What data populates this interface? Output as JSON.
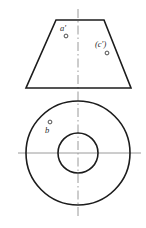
{
  "sheet": {
    "title": "Orthographic projection of a truncated cone with through hole",
    "background_color": "#ffffff",
    "width": 146,
    "height": 228
  },
  "style": {
    "outline_color": "#1c1c1c",
    "centerline_color": "#9a9a9a",
    "label_color": "#2a2a2a",
    "marker_color": "#3a3a3a"
  },
  "front_view": {
    "name": "front-view",
    "shape": "trapezoid",
    "description": "Front view of truncated cone (frustum)",
    "top_left_x": 56,
    "top_right_x": 104,
    "top_y": 20,
    "bottom_left_x": 26,
    "bottom_right_x": 131,
    "bottom_y": 88,
    "points": [
      {
        "id": "a-prime",
        "label": "a'",
        "label_x": 63,
        "label_y": 31,
        "marker_x": 66,
        "marker_y": 36,
        "marker_r": 1.9,
        "hidden": false
      },
      {
        "id": "c-prime",
        "label": "(c')",
        "label_x": 95,
        "label_y": 47,
        "marker_x": 107,
        "marker_y": 53,
        "marker_r": 1.9,
        "hidden": true
      }
    ]
  },
  "top_view": {
    "name": "top-view",
    "shape": "concentric-circles",
    "description": "Top view showing outer base circle and inner hole circle",
    "center_x": 78,
    "center_y": 153,
    "outer_radius": 52,
    "inner_radius": 20,
    "points": [
      {
        "id": "b",
        "label": "b",
        "label_x": 47,
        "label_y": 133,
        "marker_x": 50,
        "marker_y": 122,
        "marker_r": 1.9,
        "hidden": false
      }
    ]
  },
  "centerlines": {
    "vertical": {
      "name": "vertical-centerline",
      "x": 78,
      "y_start": 9,
      "y_end": 216
    },
    "horizontal": {
      "name": "horizontal-centerline",
      "y": 153,
      "x_start": 18,
      "x_end": 141
    }
  }
}
